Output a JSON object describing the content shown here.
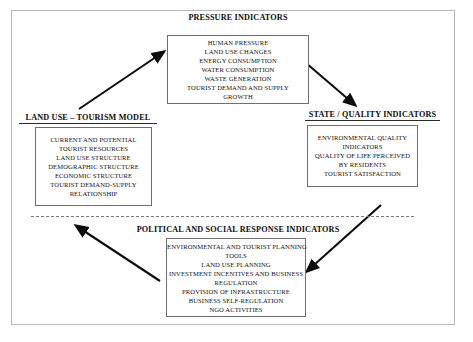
{
  "diagram": {
    "frame": {
      "visible": true,
      "color": "#b8b8b8"
    },
    "divider": {
      "style": "dashed",
      "color": "#7a7a7a"
    },
    "nodes": [
      {
        "id": "pressure",
        "title": "PRESSURE INDICATORS",
        "underlined": false,
        "lines": [
          "HUMAN PRESSURE",
          "LAND USE CHANGES",
          "ENERGY CONSUMPTION",
          "WATER CONSUMPTION",
          "WASTE GENERATION",
          "TOURIST DEMAND AND SUPPLY",
          "GROWTH"
        ]
      },
      {
        "id": "land-use",
        "title": "LAND USE – TOURISM MODEL",
        "underlined": true,
        "lines": [
          "CURRENT AND POTENTIAL",
          "TOURIST RESOURCES",
          "LAND USE  STRUCTURE",
          "DEMOGRAPHIC STRUCTURE",
          "ECONOMIC STRUCTURE",
          "TOURIST DEMAND-SUPPLY",
          "RELATIONSHIP"
        ]
      },
      {
        "id": "state",
        "title": "STATE / QUALITY INDICATORS",
        "underlined": true,
        "lines": [
          "ENVIRONMENTAL QUALITY",
          "INDICATORS",
          "QUALITY OF LIFE PERCEIVED",
          "BY RESIDENTS",
          "TOURIST SATISFACTION"
        ]
      },
      {
        "id": "response",
        "title": "POLITICAL AND SOCIAL RESPONSE INDICATORS",
        "underlined": false,
        "lines": [
          "ENVIRONMENTAL AND TOURIST PLANNING",
          "TOOLS",
          "LAND USE  PLANNING",
          "INVESTMENT INCENTIVES AND BUSINESS",
          "REGULATION",
          "PROVISION OF INFRASTRUCTURE",
          "BUSINESS SELF-REGULATION",
          "NGO  ACTIVITIES"
        ]
      }
    ],
    "arrows": [
      {
        "id": "land-use-to-pressure",
        "from": "land-use",
        "to": "pressure",
        "direction": "up-right"
      },
      {
        "id": "pressure-to-state",
        "from": "pressure",
        "to": "state",
        "direction": "down-right"
      },
      {
        "id": "state-to-response",
        "from": "state",
        "to": "response",
        "direction": "down-left"
      },
      {
        "id": "response-to-land-use",
        "from": "response",
        "to": "land-use",
        "direction": "up-left"
      }
    ]
  }
}
